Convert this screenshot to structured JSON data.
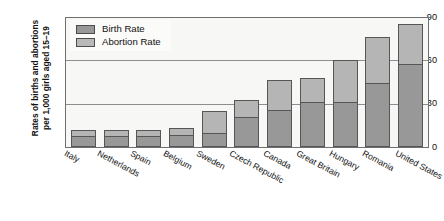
{
  "chart_data": {
    "type": "bar",
    "subtype": "stacked-bar",
    "title": "",
    "xlabel": "",
    "ylabel": "Rates of births and abortions\nper 1,000 girls aged 15–19",
    "ylim": [
      0,
      90
    ],
    "yticks": [
      0,
      30,
      60,
      90
    ],
    "ytick_labels": [
      "0",
      "30",
      "60",
      "90"
    ],
    "grid": true,
    "grid_axis": "y",
    "legend_position": "top-left",
    "categories": [
      "Italy",
      "Netherlands",
      "Spain",
      "Belgium",
      "Sweden",
      "Czech Republic",
      "Canada",
      "Great Britain",
      "Hungary",
      "Romania",
      "United States"
    ],
    "series": [
      {
        "name": "Birth Rate",
        "color": "#989898",
        "values": [
          7,
          7,
          7,
          8,
          9,
          20,
          25,
          31,
          31,
          44,
          57
        ]
      },
      {
        "name": "Abortion Rate",
        "color": "#b5b5b5",
        "values": [
          5,
          5,
          5,
          5,
          16,
          13,
          22,
          17,
          30,
          33,
          29
        ]
      }
    ],
    "totals": [
      12,
      12,
      12,
      13,
      25,
      33,
      47,
      48,
      61,
      77,
      86
    ]
  },
  "axis": {
    "y_title": "Rates of births and abortions\nper 1,000 girls aged 15–19",
    "ticks": [
      "90",
      "60",
      "30",
      "0"
    ]
  },
  "legend": {
    "entries": [
      {
        "label": "Birth Rate",
        "swatch": "birth"
      },
      {
        "label": "Abortion Rate",
        "swatch": "abortion"
      }
    ]
  },
  "colors": {
    "birth_rate": "#989898",
    "abortion_rate": "#b5b5b5",
    "bar_outline": "#565656",
    "plot_background": "#f7f7f5",
    "gridline": "#8d8d8d",
    "text": "#111111"
  }
}
